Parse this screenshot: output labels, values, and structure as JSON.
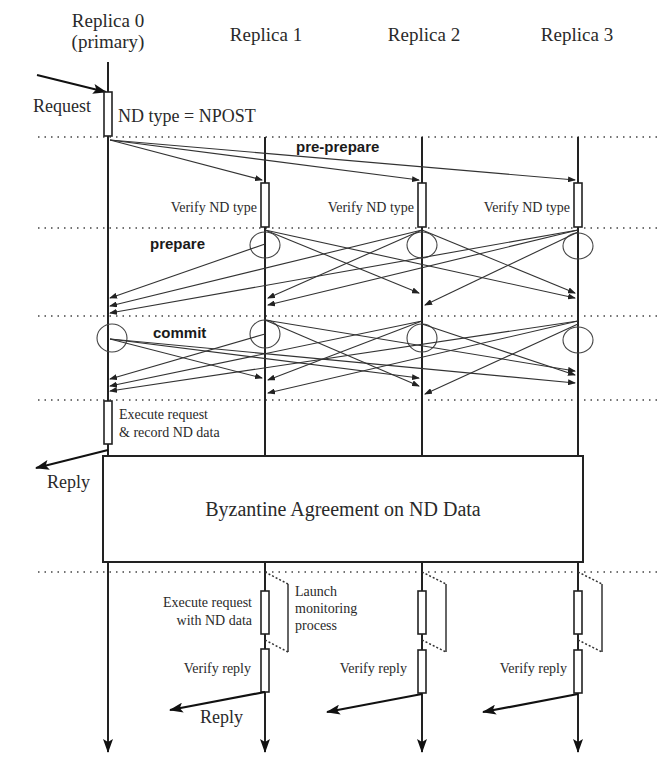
{
  "diagram": {
    "type": "sequence-diagram",
    "participants": [
      {
        "id": "r0",
        "label_line1": "Replica 0",
        "label_line2": "(primary)"
      },
      {
        "id": "r1",
        "label": "Replica 1"
      },
      {
        "id": "r2",
        "label": "Replica 2"
      },
      {
        "id": "r3",
        "label": "Replica 3"
      }
    ],
    "client": {
      "request_label": "Request",
      "reply_label": "Reply"
    },
    "primary_note": "ND type = NPOST",
    "phases": {
      "pre_prepare": "pre-prepare",
      "prepare": "prepare",
      "commit": "commit"
    },
    "verify_nd_type": [
      "Verify ND type",
      "Verify ND type",
      "Verify ND type"
    ],
    "execute_primary": {
      "line1": "Execute request",
      "line2": "& record ND data"
    },
    "primary_reply_label": "Reply",
    "agreement_box": "Byzantine Agreement on ND Data",
    "backup_execution": {
      "execute_line1": "Execute request",
      "execute_line2": "with ND data",
      "launch_line1": "Launch",
      "launch_line2": "monitoring",
      "launch_line3": "process",
      "verify_reply": [
        "Verify reply",
        "Verify reply",
        "Verify reply"
      ],
      "reply_label": "Reply"
    }
  }
}
